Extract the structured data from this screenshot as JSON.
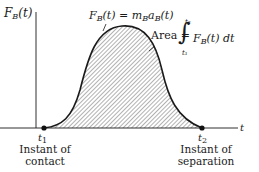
{
  "diagram": {
    "y_axis_label": {
      "symbol": "F",
      "sub": "B",
      "arg": "(t)"
    },
    "x_axis_label": "t",
    "curve_label": {
      "lhs": "F",
      "lhs_sub": "B",
      "lhs_arg": "(t)",
      "eq": " = ",
      "m": "m",
      "m_sub": "B",
      "a": "a",
      "a_sub": "B",
      "a_arg": "(t)"
    },
    "area_label": {
      "text": "Area = ",
      "integral_symbol": "∫",
      "upper_limit": "t₂",
      "lower_limit": "t₁",
      "integrand": "F",
      "integrand_sub": "B",
      "integrand_arg": "(t) dt"
    },
    "points": [
      {
        "label": "t",
        "sub": "1",
        "caption_line1": "Instant of",
        "caption_line2": "contact"
      },
      {
        "label": "t",
        "sub": "2",
        "caption_line1": "Instant of",
        "caption_line2": "separation"
      }
    ],
    "colors": {
      "line": "#1a1a1a",
      "hatch": "#555555",
      "background": "#ffffff"
    }
  }
}
